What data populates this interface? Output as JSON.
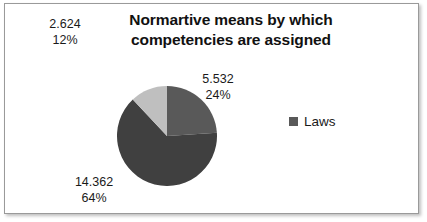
{
  "chart": {
    "title_line1": "Normartive means by which",
    "title_line2": "competencies are assigned",
    "background_color": "#FFFFFF",
    "border_color": "#9A9A9A"
  },
  "legend": {
    "swatch_icon": "legend-swatch-icon",
    "entries": [
      {
        "label": "Laws",
        "color": "#595959"
      }
    ]
  },
  "labels": {
    "slice0": {
      "value": "2.624",
      "percent": "12%"
    },
    "slice1": {
      "value": "5.532",
      "percent": "24%"
    },
    "slice2": {
      "value": "14.362",
      "percent": "64%"
    }
  },
  "chart_data": {
    "type": "pie",
    "title": "Normartive means by which competencies are assigned",
    "xlabel": "",
    "ylabel": "",
    "legend": [
      "Laws"
    ],
    "legend_position": "right",
    "grid": false,
    "start_angle_deg": 0,
    "direction": "clockwise",
    "categories": [
      "5.532",
      "14.362",
      "2.624"
    ],
    "values": [
      5.532,
      14.362,
      2.624
    ],
    "percentages": [
      24,
      64,
      12
    ],
    "labels": [
      "5.532 24%",
      "14.362 64%",
      "2.624 12%"
    ],
    "colors": [
      "#595959",
      "#404040",
      "#BFBFBF"
    ],
    "total": 22.518,
    "slices": [
      {
        "label": "5.532",
        "value": 5.532,
        "percent": 24,
        "color": "#595959"
      },
      {
        "label": "14.362",
        "value": 14.362,
        "percent": 64,
        "color": "#404040"
      },
      {
        "label": "2.624",
        "value": 2.624,
        "percent": 12,
        "color": "#BFBFBF"
      }
    ]
  }
}
